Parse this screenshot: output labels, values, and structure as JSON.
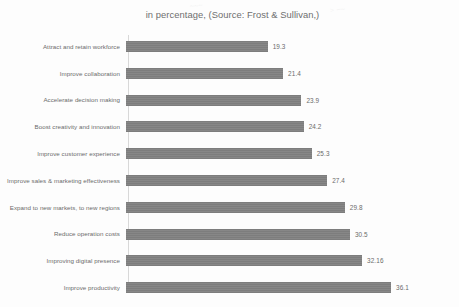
{
  "chart_data": {
    "type": "bar",
    "orientation": "horizontal",
    "title": "in percentage, (Source: Frost & Sullivan,)",
    "xlabel": "",
    "ylabel": "",
    "xlim": [
      0,
      36.1
    ],
    "grid": false,
    "legend": null,
    "bar_color": "#818181",
    "text_color": "#6b6b6b",
    "axis_color": "#d8d8d8",
    "categories": [
      "Attract and retain workforce",
      "Improve collaboration",
      "Accelerate decision making",
      "Boost creativity and innovation",
      "Improve customer experience",
      "Improve sales & marketing effectiveness",
      "Expand to new markets, to new regions",
      "Reduce operation costs",
      "Improving digital presence",
      "Improve productivity"
    ],
    "values": [
      19.3,
      21.4,
      23.9,
      24.2,
      25.3,
      27.4,
      29.8,
      30.5,
      32.16,
      36.1
    ],
    "value_labels": [
      "19.3",
      "21.4",
      "23.9",
      "24.2",
      "25.3",
      "27.4",
      "29.8",
      "30.5",
      "32.16",
      "36.1"
    ]
  },
  "scan_marks": {
    "mark_a": "~~~",
    "mark_b": "> ~~"
  }
}
